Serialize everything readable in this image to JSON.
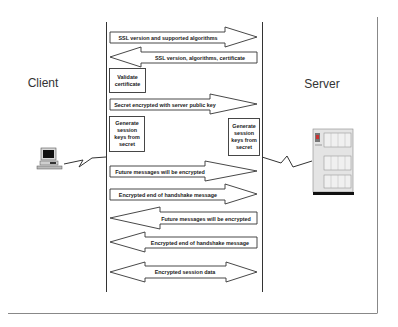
{
  "diagram": {
    "parties": {
      "client": {
        "label": "Client",
        "icon": "desktop-computer-icon"
      },
      "server": {
        "label": "Server",
        "icon": "server-cabinet-icon"
      }
    },
    "messages": [
      {
        "id": 1,
        "label": "SSL version and supported algorithms",
        "direction": "client-to-server"
      },
      {
        "id": 2,
        "label": "SSL version, algorithms, certificate",
        "direction": "server-to-client"
      },
      {
        "id": 3,
        "label": "Secret encrypted with server public key",
        "direction": "client-to-server"
      },
      {
        "id": 4,
        "label": "Future messages will be encrypted",
        "direction": "client-to-server"
      },
      {
        "id": 5,
        "label": "Encrypted end of handshake message",
        "direction": "client-to-server"
      },
      {
        "id": 6,
        "label": "Future messages will be encrypted",
        "direction": "server-to-client"
      },
      {
        "id": 7,
        "label": "Encrypted end of handshake message",
        "direction": "server-to-client"
      },
      {
        "id": 8,
        "label": "Encrypted session data",
        "direction": "bidirectional"
      }
    ],
    "actions": {
      "validate_certificate": {
        "line1": "Validate",
        "line2": "certificate",
        "side": "client"
      },
      "client_generate_keys": {
        "line1": "Generate",
        "line2": "session",
        "line3": "keys from",
        "line4": "secret",
        "side": "client"
      },
      "server_generate_keys": {
        "line1": "Generate",
        "line2": "session",
        "line3": "keys from",
        "line4": "secret",
        "side": "server"
      }
    },
    "colors": {
      "stroke": "#333333",
      "frame": "#888888",
      "text": "#1a1a1a",
      "background": "#ffffff"
    }
  }
}
